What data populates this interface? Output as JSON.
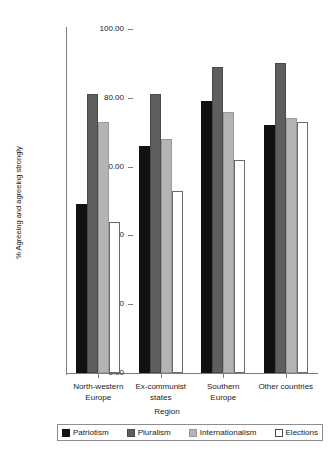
{
  "chart_data": {
    "type": "bar",
    "title": "",
    "xlabel": "Region",
    "ylabel": "% Agreeing and agreeing strongly",
    "ylim": [
      0,
      100
    ],
    "ytick_labels": [
      "0.00",
      "20.00",
      "40.00",
      "60.00",
      "80.00",
      "100.00"
    ],
    "ytick_values": [
      0,
      20,
      40,
      60,
      80,
      100
    ],
    "grid": false,
    "legend_position": "bottom",
    "categories": [
      "North-western\nEurope",
      "Ex-communist\nstates",
      "Southern\nEurope",
      "Other countries"
    ],
    "series": [
      {
        "name": "Patriotism",
        "color": "#111111",
        "values": [
          49,
          66,
          79,
          72
        ]
      },
      {
        "name": "Pluralism",
        "color": "#5e5e5e",
        "values": [
          81,
          81,
          89,
          90
        ]
      },
      {
        "name": "Internationalism",
        "color": "#b4b4b4",
        "values": [
          73,
          68,
          76,
          74
        ]
      },
      {
        "name": "Elections",
        "color": "#ffffff",
        "values": [
          44,
          53,
          62,
          73
        ]
      }
    ]
  }
}
